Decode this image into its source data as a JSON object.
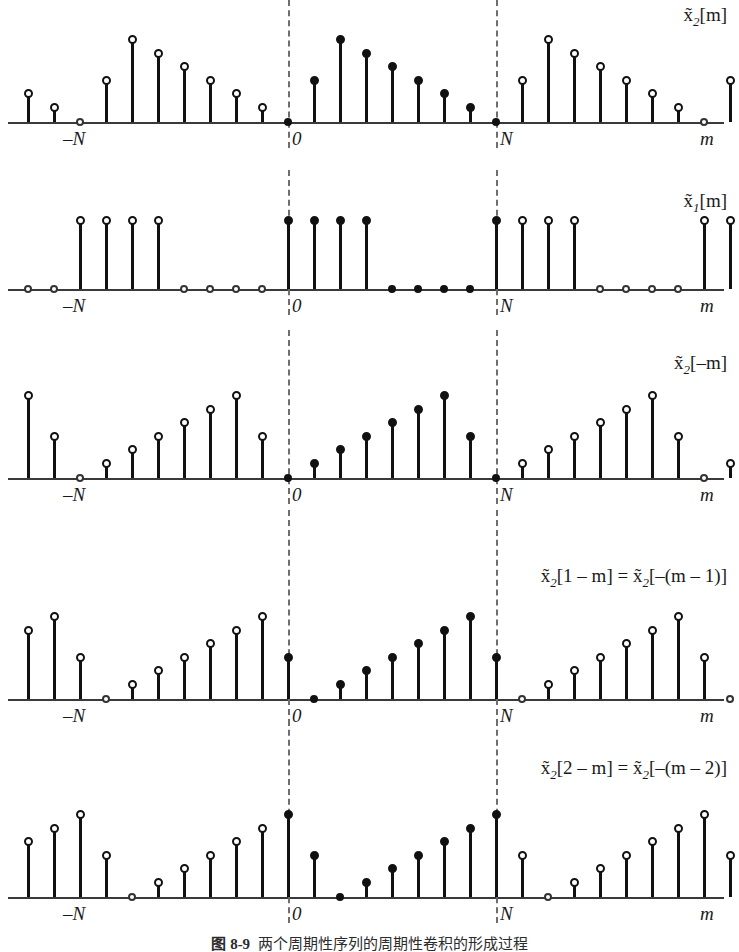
{
  "figure": {
    "axis_name": "m",
    "tick_neg_n": "–N",
    "tick_zero": "0",
    "tick_n": "N",
    "period": 8,
    "x_min": -17,
    "x_max": 17,
    "colors": {
      "stem": "#111111",
      "axis": "#3a3a3a",
      "dashed_guide": "#6e6e6e",
      "background": "#ffffff"
    }
  },
  "caption": {
    "label": "图 8-9",
    "text": "两个周期性序列的周期性卷积的形成过程"
  },
  "panels": [
    {
      "id": "x2-m",
      "label": "x̃2[m]",
      "label_html": "x̃<sub>2</sub>[m]",
      "base": [
        0,
        3,
        6,
        5,
        4,
        3,
        2,
        1
      ],
      "description": "periodic sequence x2 tilde of m"
    },
    {
      "id": "x1-m",
      "label": "x̃1[m]",
      "label_html": "x̃<sub>1</sub>[m]",
      "base": [
        5,
        5,
        5,
        5,
        0,
        0,
        0,
        0
      ],
      "description": "periodic rectangular pulse x1 tilde of m"
    },
    {
      "id": "x2-minus-m",
      "label": "x̃2[-m]",
      "label_html": "x̃<sub>2</sub>[–m]",
      "base": [
        0,
        1,
        2,
        3,
        4,
        5,
        6,
        3
      ],
      "description": "time reversed x2 tilde"
    },
    {
      "id": "x2-1-minus-m",
      "label": "x̃2[1-m] = x̃2[-(m-1)]",
      "label_html": "x̃<sub>2</sub>[1 – m] = x̃<sub>2</sub>[–(m – 1)]",
      "base": [
        3,
        0,
        1,
        2,
        3,
        4,
        5,
        6
      ],
      "description": "time reversed and shifted by one"
    },
    {
      "id": "x2-2-minus-m",
      "label": "x̃2[2-m] = x̃2[-(m-2)]",
      "label_html": "x̃<sub>2</sub>[2 – m] = x̃<sub>2</sub>[–(m – 2)]",
      "base": [
        6,
        3,
        0,
        1,
        2,
        3,
        4,
        5
      ],
      "description": "time reversed and shifted by two"
    }
  ],
  "chart_data": {
    "type": "line",
    "title": "",
    "xlabel": "m",
    "ylabel": "",
    "grid": false,
    "legend": "none",
    "x": [
      -17,
      -16,
      -15,
      -14,
      -13,
      -12,
      -11,
      -10,
      -9,
      -8,
      -7,
      -6,
      -5,
      -4,
      -3,
      -2,
      -1,
      0,
      1,
      2,
      3,
      4,
      5,
      6,
      7,
      8,
      9,
      10,
      11,
      12,
      13,
      14,
      15,
      16,
      17
    ],
    "series": [
      {
        "name": "x̃₂[m]",
        "values": [
          3,
          2,
          1,
          0,
          3,
          6,
          5,
          4,
          3,
          2,
          1,
          0,
          3,
          6,
          5,
          4,
          3,
          2,
          1,
          0,
          3,
          6,
          5,
          4,
          3,
          2,
          1,
          0,
          3,
          6,
          5,
          4,
          3,
          2,
          1
        ]
      },
      {
        "name": "x̃₁[m]",
        "values": [
          0,
          0,
          0,
          5,
          5,
          5,
          5,
          0,
          0,
          0,
          0,
          5,
          5,
          5,
          5,
          0,
          0,
          0,
          0,
          5,
          5,
          5,
          5,
          0,
          0,
          0,
          0,
          5,
          5,
          5,
          5,
          0,
          0,
          0,
          0
        ]
      },
      {
        "name": "x̃₂[–m]",
        "values": [
          1,
          2,
          3,
          4,
          5,
          6,
          3,
          0,
          1,
          2,
          3,
          4,
          5,
          6,
          3,
          0,
          1,
          2,
          3,
          4,
          5,
          6,
          3,
          0,
          1,
          2,
          3,
          4,
          5,
          6,
          3,
          0,
          1,
          2,
          3
        ]
      },
      {
        "name": "x̃₂[1 – m]",
        "values": [
          0,
          1,
          2,
          3,
          4,
          5,
          6,
          3,
          0,
          1,
          2,
          3,
          4,
          5,
          6,
          3,
          0,
          1,
          2,
          3,
          4,
          5,
          6,
          3,
          0,
          1,
          2,
          3,
          4,
          5,
          6,
          3,
          0,
          1,
          2
        ]
      },
      {
        "name": "x̃₂[2 – m]",
        "values": [
          3,
          0,
          1,
          2,
          3,
          4,
          5,
          6,
          3,
          0,
          1,
          2,
          3,
          4,
          5,
          6,
          3,
          0,
          1,
          2,
          3,
          4,
          5,
          6,
          3,
          0,
          1,
          2,
          3,
          4,
          5,
          6,
          3,
          0,
          1
        ]
      }
    ],
    "annotations": [
      {
        "text": "–N",
        "x": -8
      },
      {
        "text": "0",
        "x": 0
      },
      {
        "text": "N",
        "x": 8
      }
    ]
  }
}
